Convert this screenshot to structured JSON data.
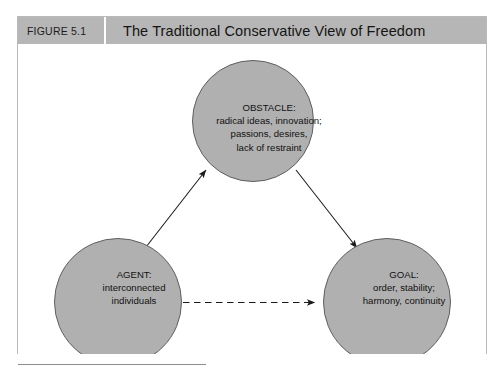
{
  "figure": {
    "number_label": "FIGURE 5.1",
    "title": "The Traditional Conservative View of Freedom"
  },
  "diagram": {
    "type": "triad-node-diagram",
    "nodes": [
      {
        "id": "obstacle",
        "title": "OBSTACLE:",
        "lines": [
          "radical ideas, innovation;",
          "passions, desires,",
          "lack of restraint"
        ]
      },
      {
        "id": "agent",
        "title": "AGENT:",
        "lines": [
          "interconnected",
          "individuals"
        ]
      },
      {
        "id": "goal",
        "title": "GOAL:",
        "lines": [
          "order, stability;",
          "harmony, continuity"
        ]
      }
    ],
    "connectors": [
      {
        "id": "agent-to-obstacle",
        "from": "agent",
        "to": "obstacle",
        "style": "solid",
        "arrow": "end"
      },
      {
        "id": "obstacle-to-goal",
        "from": "obstacle",
        "to": "goal",
        "style": "solid",
        "arrow": "end"
      },
      {
        "id": "agent-to-goal",
        "from": "agent",
        "to": "goal",
        "style": "dashed",
        "arrow": "end"
      }
    ]
  },
  "colors": {
    "header_bar": "#b6b6b6",
    "circle_fill": "#b0b0b0",
    "circle_stroke": "#5f5f5f",
    "box_border": "#b9b9b9",
    "connector": "#1a1a1a",
    "text": "#111111",
    "page_background": "#ffffff"
  }
}
